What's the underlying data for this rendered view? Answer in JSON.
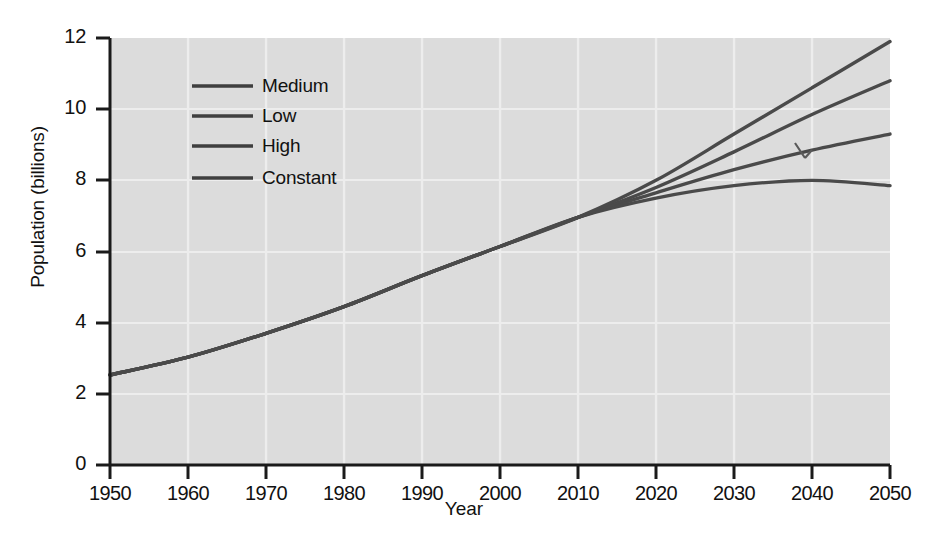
{
  "figure": {
    "background_color": "#ffffff",
    "plot_background_color": "#dcdcdc",
    "grid_color": "#ececec",
    "axis_color": "#1a1a1a",
    "line_color": "#4a4a4a",
    "caption_partial": ""
  },
  "axes": {
    "x_title": "Year",
    "y_title": "Population (billions)",
    "x_ticks": [
      "1950",
      "1960",
      "1970",
      "1980",
      "1990",
      "2000",
      "2010",
      "2020",
      "2030",
      "2040",
      "2050"
    ],
    "y_ticks": [
      "0",
      "2",
      "4",
      "6",
      "8",
      "10",
      "12"
    ]
  },
  "legend": {
    "entries": [
      {
        "label": "Medium",
        "color": "#4a4a4a"
      },
      {
        "label": "Low",
        "color": "#4a4a4a"
      },
      {
        "label": "High",
        "color": "#4a4a4a"
      },
      {
        "label": "Constant",
        "color": "#4a4a4a"
      }
    ]
  },
  "chart_data": {
    "type": "line",
    "title": "",
    "subtitle": "",
    "xlabel": "Year",
    "ylabel": "Population (billions)",
    "xlim": [
      1950,
      2050
    ],
    "ylim": [
      0,
      12
    ],
    "xticks": [
      1950,
      1960,
      1970,
      1980,
      1990,
      2000,
      2010,
      2020,
      2030,
      2040,
      2050
    ],
    "yticks": [
      0,
      2,
      4,
      6,
      8,
      10,
      12
    ],
    "grid": true,
    "legend_position": "upper-left-inside",
    "annotations": [
      {
        "type": "tick-mark",
        "x": 2035,
        "y": 9.05,
        "note": "small stray pen/scan mark above High curve"
      }
    ],
    "x": [
      1950,
      1960,
      1970,
      1980,
      1990,
      2000,
      2010,
      2020,
      2030,
      2040,
      2050
    ],
    "series": [
      {
        "name": "High",
        "values": [
          2.53,
          3.03,
          3.7,
          4.45,
          5.32,
          6.14,
          6.96,
          8.0,
          9.3,
          10.6,
          11.9
        ]
      },
      {
        "name": "Medium",
        "values": [
          2.53,
          3.03,
          3.7,
          4.45,
          5.32,
          6.14,
          6.96,
          7.8,
          8.8,
          9.85,
          10.8
        ]
      },
      {
        "name": "Low",
        "values": [
          2.53,
          3.03,
          3.7,
          4.45,
          5.32,
          6.14,
          6.96,
          7.65,
          8.3,
          8.85,
          9.3
        ]
      },
      {
        "name": "Constant",
        "values": [
          2.53,
          3.03,
          3.7,
          4.45,
          5.32,
          6.14,
          6.96,
          7.5,
          7.85,
          8.0,
          7.85
        ]
      }
    ]
  }
}
